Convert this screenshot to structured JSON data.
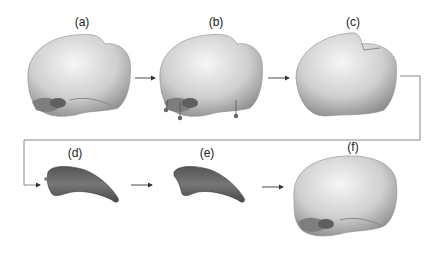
{
  "figure": {
    "panels": [
      {
        "id": "a",
        "label": "(a)",
        "content": "skull model"
      },
      {
        "id": "b",
        "label": "(b)",
        "content": "skull model with landmark points"
      },
      {
        "id": "c",
        "label": "(c)",
        "content": "cranial vault"
      },
      {
        "id": "d",
        "label": "(d)",
        "content": "bone fragment with landmark"
      },
      {
        "id": "e",
        "label": "(e)",
        "content": "bone fragment"
      },
      {
        "id": "f",
        "label": "(f)",
        "content": "reconstructed skull"
      }
    ],
    "colors": {
      "bone_light": "#e8e8e8",
      "bone_shade": "#9a9a9a",
      "fragment": "#6b6b6b",
      "fragment_dark": "#4a4a4a",
      "arrow": "#333333",
      "connector": "#7a7a7a"
    }
  }
}
